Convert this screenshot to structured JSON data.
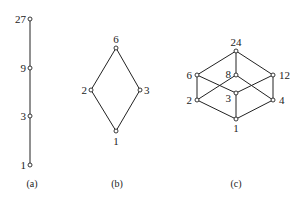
{
  "figure": {
    "a": {
      "caption": "(a)",
      "nodes": [
        {
          "id": "27",
          "label": "27",
          "x": 30,
          "y": 19
        },
        {
          "id": "9",
          "label": "9",
          "x": 30,
          "y": 68
        },
        {
          "id": "3",
          "label": "3",
          "x": 30,
          "y": 116
        },
        {
          "id": "1",
          "label": "1",
          "x": 30,
          "y": 165
        }
      ],
      "edges": [
        [
          "27",
          "9"
        ],
        [
          "9",
          "3"
        ],
        [
          "3",
          "1"
        ]
      ]
    },
    "b": {
      "caption": "(b)",
      "nodes": [
        {
          "id": "6",
          "label": "6",
          "x": 116,
          "y": 48
        },
        {
          "id": "2",
          "label": "2",
          "x": 91,
          "y": 90
        },
        {
          "id": "3",
          "label": "3",
          "x": 140,
          "y": 90
        },
        {
          "id": "1",
          "label": "1",
          "x": 116,
          "y": 131
        }
      ],
      "edges": [
        [
          "6",
          "2"
        ],
        [
          "6",
          "3"
        ],
        [
          "2",
          "1"
        ],
        [
          "3",
          "1"
        ]
      ]
    },
    "c": {
      "caption": "(c)",
      "nodes": [
        {
          "id": "24",
          "label": "24",
          "x": 236,
          "y": 51
        },
        {
          "id": "6",
          "label": "6",
          "x": 197,
          "y": 75
        },
        {
          "id": "8",
          "label": "8",
          "x": 236,
          "y": 75
        },
        {
          "id": "12",
          "label": "12",
          "x": 273,
          "y": 75
        },
        {
          "id": "2",
          "label": "2",
          "x": 197,
          "y": 100
        },
        {
          "id": "3",
          "label": "3",
          "x": 236,
          "y": 93
        },
        {
          "id": "4",
          "label": "4",
          "x": 273,
          "y": 100
        },
        {
          "id": "1",
          "label": "1",
          "x": 236,
          "y": 119
        }
      ],
      "edges": [
        [
          "24",
          "6"
        ],
        [
          "24",
          "8"
        ],
        [
          "24",
          "12"
        ],
        [
          "6",
          "2"
        ],
        [
          "6",
          "3"
        ],
        [
          "8",
          "2"
        ],
        [
          "8",
          "4"
        ],
        [
          "12",
          "3"
        ],
        [
          "12",
          "4"
        ],
        [
          "2",
          "1"
        ],
        [
          "3",
          "1"
        ],
        [
          "4",
          "1"
        ]
      ]
    }
  }
}
